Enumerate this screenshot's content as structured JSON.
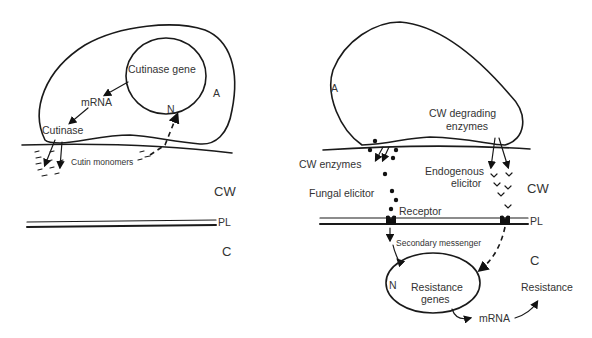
{
  "left_panel": {
    "nucleus_text": "Cutinase gene",
    "nucleus_label": "N",
    "appressorium_label": "A",
    "mrna": "mRNA",
    "cutinase": "Cutinase",
    "cutin_monomers": "Cutin monomers",
    "cell_wall": "CW",
    "plasmalemma": "PL",
    "cytoplasm": "C"
  },
  "right_panel": {
    "appressorium_label": "A",
    "cw_degrading": "CW degrading",
    "enzymes": "enzymes",
    "cw_enzymes": "CW enzymes",
    "endogenous": "Endogenous",
    "elicitor": "elicitor",
    "fungal_elicitor": "Fungal elicitor",
    "cell_wall": "CW",
    "receptor": "Receptor",
    "plasmalemma": "PL",
    "secondary_messenger": "Secondary  messenger",
    "cytoplasm": "C",
    "nucleus_label": "N",
    "resistance_genes_1": "Resistance",
    "resistance_genes_2": "genes",
    "mrna": "mRNA",
    "resistance": "Resistance"
  }
}
